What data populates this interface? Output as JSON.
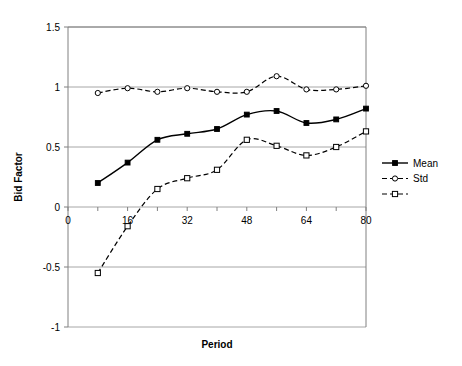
{
  "chart_data": {
    "type": "line",
    "title": "",
    "xlabel": "Period",
    "ylabel": "Bid Factor",
    "xlim": [
      0,
      80
    ],
    "ylim": [
      -1,
      1.5
    ],
    "x_ticks": [
      0,
      16,
      32,
      48,
      64,
      80
    ],
    "y_ticks": [
      -1,
      -0.5,
      0,
      0.5,
      1,
      1.5
    ],
    "x_tick_labels": [
      "0",
      "16",
      "32",
      "48",
      "64",
      "80"
    ],
    "y_tick_labels": [
      "-1",
      "-0.5",
      "0",
      "0.5",
      "1",
      "1.5"
    ],
    "grid": "horizontal",
    "legend_position": "right",
    "x": [
      8,
      16,
      24,
      32,
      40,
      48,
      56,
      64,
      72,
      80
    ],
    "series": [
      {
        "name": "Mean",
        "style": "solid",
        "marker": "filled-square",
        "values": [
          0.2,
          0.37,
          0.56,
          0.61,
          0.65,
          0.77,
          0.8,
          0.7,
          0.73,
          0.82
        ]
      },
      {
        "name": "Std",
        "style": "dashed",
        "marker": "open-circle",
        "values": [
          0.95,
          0.99,
          0.96,
          0.99,
          0.96,
          0.96,
          1.09,
          0.98,
          0.98,
          1.01
        ]
      },
      {
        "name": "",
        "style": "dashed",
        "marker": "open-square",
        "values": [
          -0.55,
          -0.16,
          0.15,
          0.24,
          0.31,
          0.56,
          0.51,
          0.43,
          0.5,
          0.63
        ]
      }
    ],
    "colors": {
      "line": "#000000",
      "grid": "#a6a6a6",
      "axis": "#808080",
      "background": "#ffffff"
    }
  },
  "legend": {
    "entries": [
      {
        "label": "Mean"
      },
      {
        "label": "Std"
      },
      {
        "label": ""
      }
    ]
  }
}
